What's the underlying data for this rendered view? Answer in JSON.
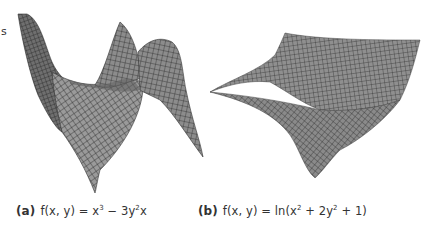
{
  "figure": {
    "edge_text": "s",
    "panels": [
      {
        "id": "a",
        "label": "(a)",
        "formula_prefix": "f(x, y) = x",
        "formula_sup1": "3",
        "formula_mid": " − 3y",
        "formula_sup2": "2",
        "formula_suffix": "x",
        "surface": "monkey-saddle",
        "fill_color": "#8a8a8a",
        "mesh_color": "#2a2a2a"
      },
      {
        "id": "b",
        "label": "(b)",
        "formula_prefix": "f(x, y) = ln(x",
        "formula_sup1": "2",
        "formula_mid": " + 2y",
        "formula_sup2": "2",
        "formula_suffix": " + 1)",
        "surface": "log-bowl",
        "fill_color": "#8e8e8e",
        "mesh_color": "#2a2a2a"
      }
    ]
  }
}
